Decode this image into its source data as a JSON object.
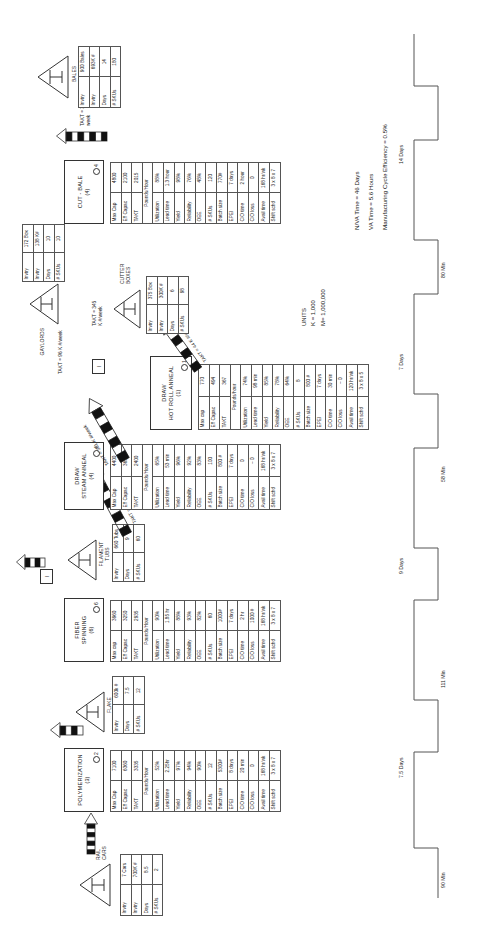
{
  "units_note": "UNITS\nK = 1,000\nM= 1,000,000",
  "summary": {
    "nva": "N/VA Time = 46 Days",
    "va": "VA Time = 5.6 Hours",
    "mce": "Manufacturing Cycle Efficiency = 0.5%"
  },
  "inventories": [
    {
      "id": "rail-cars",
      "name": "RAIL\nCARS",
      "rows": [
        [
          "Invtry",
          "7 Cars"
        ],
        [
          "Invtry",
          "700K #"
        ],
        [
          "Days",
          "8.5"
        ],
        [
          "# SKUs",
          "2"
        ]
      ]
    },
    {
      "id": "flake-silos",
      "name": "FLAKE\nSILOS (12)",
      "rows": [
        [
          "Invtry",
          "600k #"
        ],
        [
          "Days",
          "7.5"
        ],
        [
          "# SKUs",
          "12"
        ]
      ]
    },
    {
      "id": "filament-tubs",
      "name": "FILAMENT\nTUBS",
      "rows": [
        [
          "Invtry",
          "660 Tubs"
        ],
        [
          "Days",
          "9"
        ],
        [
          "# SKUs",
          "60"
        ]
      ]
    },
    {
      "id": "cutter-boxes",
      "name": "CUTTER\nBOXES",
      "rows": [
        [
          "Invtry",
          "375 Box"
        ],
        [
          "Invtry",
          "300K #"
        ],
        [
          "Days",
          "6"
        ],
        [
          "# SKUs",
          "98"
        ]
      ]
    },
    {
      "id": "gaylords",
      "name": "GAYLORDS",
      "rows": [
        [
          "Invtry",
          "172 Box"
        ],
        [
          "Invtry",
          "138 K#"
        ],
        [
          "Days",
          "10"
        ],
        [
          "# SKUs",
          "10"
        ]
      ]
    },
    {
      "id": "bales",
      "name": "BALES",
      "rows": [
        [
          "Invtry",
          "900 Bales"
        ],
        [
          "Invtry",
          "693K #"
        ],
        [
          "Days",
          "14"
        ],
        [
          "# SKUs",
          "180"
        ]
      ]
    }
  ],
  "processes": [
    {
      "id": "polymerization",
      "name": "POLYMERIZATION",
      "count": "(3)",
      "op": "2",
      "rows": [
        [
          "Max Cap",
          "7100"
        ],
        [
          "Eff Capac",
          "6360"
        ],
        [
          "TAKT",
          "3335"
        ],
        [
          "Pounds/Hour",
          ""
        ],
        [
          "Utilization",
          "52%"
        ],
        [
          "Lead time",
          "2.25hr"
        ],
        [
          "Yield",
          "97%"
        ],
        [
          "Reliability",
          "94%"
        ],
        [
          "OEE",
          "90%"
        ],
        [
          "# SKUs",
          "12"
        ],
        [
          "Batch size",
          "5300#"
        ],
        [
          "EPEI",
          "8 days"
        ],
        [
          "C/O time",
          "20 min"
        ],
        [
          "C/O loss",
          "0"
        ],
        [
          "Avail time",
          "168 hr/wk"
        ],
        [
          "Shift schd",
          "3 x 8 x 7"
        ]
      ]
    },
    {
      "id": "fiber-spinning",
      "name": "FIBER\nSPINNING",
      "count": "(6)",
      "op": "6",
      "rows": [
        [
          "Max cap",
          "3960"
        ],
        [
          "Eff Capac",
          "3250"
        ],
        [
          "TAKT",
          "2935"
        ],
        [
          "Pounds/Hour",
          ""
        ],
        [
          "Utilization",
          "90%"
        ],
        [
          "Lead time",
          "1.85 hr"
        ],
        [
          "Yield",
          "88%"
        ],
        [
          "Reliability",
          "93%"
        ],
        [
          "OEE",
          "82%"
        ],
        [
          "# SKUs",
          "60"
        ],
        [
          "Batch size",
          "1000#"
        ],
        [
          "EPEI",
          "7 days"
        ],
        [
          "C/O time",
          "2 hr"
        ],
        [
          "C/O loss",
          "1000 #"
        ],
        [
          "Avail time",
          "168 hr/wk"
        ],
        [
          "Shift schd",
          "3 x 8 x 7"
        ]
      ]
    },
    {
      "id": "draw-steam-anneal",
      "name": "DRAW\nSTEAM ANNEAL",
      "count": "(4)",
      "op": "4",
      "rows": [
        [
          "Max Cap",
          "4400"
        ],
        [
          "Eff Capac",
          "3650"
        ],
        [
          "TAKT",
          "2400"
        ],
        [
          "Pounds/Hour",
          ""
        ],
        [
          "Utilization",
          "65%"
        ],
        [
          "Lead time",
          "53 min"
        ],
        [
          "Yield",
          "96%"
        ],
        [
          "Reliability",
          "92%"
        ],
        [
          "OEE",
          "83%"
        ],
        [
          "# SKUs",
          "100"
        ],
        [
          "Batch size",
          "800 #"
        ],
        [
          "EPEI",
          "7 days"
        ],
        [
          "C/O time",
          "0"
        ],
        [
          "C/O loss",
          "~ 0"
        ],
        [
          "Avail time",
          "168 hr/wk"
        ],
        [
          "Shift schd",
          "3 x 8 x 7"
        ]
      ]
    },
    {
      "id": "draw-hot-roll-anneal",
      "name": "DRAW\nHOT ROLL ANNEAL",
      "count": "(1)",
      "op": "1",
      "rows": [
        [
          "Max cap",
          "770"
        ],
        [
          "Eff Capac",
          "494"
        ],
        [
          "TAKT",
          "367"
        ],
        [
          "Pounds/hour",
          ""
        ],
        [
          "Utilization",
          "74%"
        ],
        [
          "Lead time",
          "98 min"
        ],
        [
          "Yield",
          "85%"
        ],
        [
          "Reliability",
          "78%"
        ],
        [
          "OEE",
          "64%"
        ],
        [
          "# SKUs",
          "8"
        ],
        [
          "Batch size",
          "800 #"
        ],
        [
          "EPEI",
          "7 days"
        ],
        [
          "C/O time",
          "30 min"
        ],
        [
          "C/O loss",
          "~ 0"
        ],
        [
          "Avail time",
          "120 hr/wk"
        ],
        [
          "Shift schd",
          "3 x 8 x 5"
        ]
      ]
    },
    {
      "id": "cut-bale",
      "name": "CUT - BALE",
      "count": "(4)",
      "op": "4",
      "rows": [
        [
          "Max Cap",
          "4800"
        ],
        [
          "Eff Capac",
          "2100"
        ],
        [
          "TAKT",
          "2015"
        ],
        [
          "Pounds/Hour",
          ""
        ],
        [
          "Utilization",
          "88%"
        ],
        [
          "Lead time",
          "1.3 hour"
        ],
        [
          "Yield",
          "98%"
        ],
        [
          "Reliability",
          "76%"
        ],
        [
          "OEE",
          "48%"
        ],
        [
          "# SKUs",
          "120"
        ],
        [
          "Batch size",
          "770#"
        ],
        [
          "EPEI",
          "7 days"
        ],
        [
          "C/O time",
          "2 hour"
        ],
        [
          "C/O loss",
          "0"
        ],
        [
          "Avail time",
          "168 hr/wk"
        ],
        [
          "Shift schd",
          "3 x 8 x 7"
        ]
      ]
    }
  ],
  "flows": [
    {
      "id": "flow-rail-poly",
      "takt": ""
    },
    {
      "id": "flow-flake-spin",
      "takt": ""
    },
    {
      "id": "flow-spin-tubs",
      "takt": "TAKT = 52K #/week"
    },
    {
      "id": "flow-tubs-draw",
      "takt": "TAKT = 52K #/week"
    },
    {
      "id": "flow-draw-cutter",
      "takt": "TAKT = 301 K #/week"
    },
    {
      "id": "flow-hotroll-cutter",
      "takt": "TAKT = 44 K #/week"
    },
    {
      "id": "flow-cutter-cut",
      "takt": "TAKT = 345\nK #/week"
    },
    {
      "id": "flow-gaylords",
      "takt": "TAKT = 96 K #/week"
    },
    {
      "id": "flow-bales",
      "takt": "TAKT = 338 K #/\nweek"
    }
  ],
  "kanban": [
    {
      "id": "kanban-1",
      "label": "I"
    },
    {
      "id": "kanban-2",
      "label": "I"
    }
  ],
  "timeline": {
    "segments": [
      {
        "label": "90 Min",
        "type": "va"
      },
      {
        "label": "7.5 Days",
        "type": "nva"
      },
      {
        "label": "111 Min",
        "type": "va"
      },
      {
        "label": "9 Days",
        "type": "nva"
      },
      {
        "label": "58 Min",
        "type": "va"
      },
      {
        "label": "7 Days",
        "type": "nva"
      },
      {
        "label": "80 Min",
        "type": "va"
      },
      {
        "label": "14 Days",
        "type": "nva"
      }
    ]
  }
}
